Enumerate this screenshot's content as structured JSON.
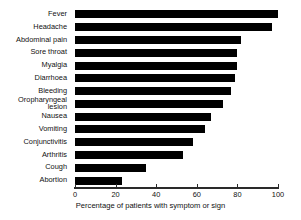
{
  "chart_data": {
    "type": "bar",
    "orientation": "horizontal",
    "title": "",
    "xlabel": "Percentage of patients with symptom or sign",
    "ylabel": "",
    "xlim": [
      0,
      100
    ],
    "xticks": [
      0,
      20,
      40,
      60,
      80,
      100
    ],
    "grid": false,
    "legend": null,
    "bar_color": "#000000",
    "axis_color": "#2a2a2a",
    "categories": [
      "Fever",
      "Headache",
      "Abdominal pain",
      "Sore throat",
      "Myalgia",
      "Diarrhoea",
      "Bleeding",
      "Oropharyngeal\nlesion",
      "Nausea",
      "Vomiting",
      "Conjunctivitis",
      "Arthritis",
      "Cough",
      "Abortion"
    ],
    "values": [
      100,
      97,
      82,
      80,
      80,
      79,
      77,
      73,
      67,
      64,
      58,
      53,
      35,
      23
    ]
  }
}
